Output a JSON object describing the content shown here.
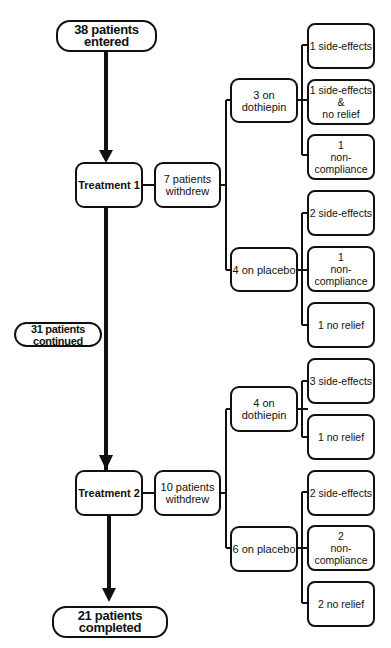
{
  "diagram": {
    "type": "patient-flow",
    "start": {
      "label": "38 patients entered"
    },
    "continued": {
      "label": "31 patients continued"
    },
    "end": {
      "label": "21 patients completed"
    },
    "treatments": [
      {
        "label": "Treatment 1",
        "withdrew": "7 patients\nwithdrew",
        "groups": [
          {
            "label": "3 on dothiepin",
            "reasons": [
              "1 side-effects",
              "1 side-effects &\nno relief",
              "1\nnon-compliance"
            ]
          },
          {
            "label": "4 on placebo",
            "reasons": [
              "2 side-effects",
              "1\nnon-compliance",
              "1 no relief"
            ]
          }
        ]
      },
      {
        "label": "Treatment 2",
        "withdrew": "10 patients\nwithdrew",
        "groups": [
          {
            "label": "4 on dothiepin",
            "reasons": [
              "3 side-effects",
              "1 no relief"
            ]
          },
          {
            "label": "6 on placebo",
            "reasons": [
              "2 side-effects",
              "2\nnon-compliance",
              "2 no relief"
            ]
          }
        ]
      }
    ],
    "colors": {
      "stroke": "#111111",
      "background": "#ffffff"
    }
  }
}
